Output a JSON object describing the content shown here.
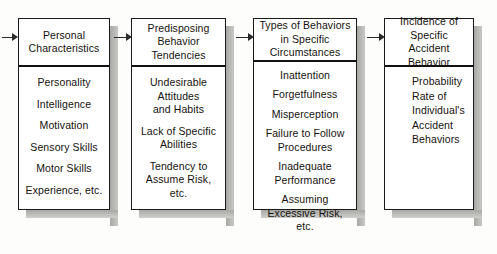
{
  "diagram": {
    "background_color": "#fdfdfc",
    "text_color": "#15110e",
    "shadow_color": "#a8a8a4",
    "boxes": [
      {
        "id": "personal-characteristics",
        "header": "Personal\nCharacteristics",
        "align": "center",
        "entries": [
          "Personality",
          "Intelligence",
          "Motivation",
          "Sensory Skills",
          "Motor Skills",
          "Experience, etc."
        ]
      },
      {
        "id": "predisposing-behavior-tendencies",
        "header": "Predisposing\nBehavior\nTendencies",
        "align": "center",
        "entries": [
          "Undesirable\nAttitudes\nand Habits",
          "Lack of Specific\nAbilities",
          "Tendency to\nAssume Risk, etc."
        ]
      },
      {
        "id": "types-of-behaviors",
        "header": "Types of Behaviors\nin Specific\nCircumstances",
        "align": "center",
        "entries": [
          "Inattention",
          "Forgetfulness",
          "Misperception",
          "Failure to Follow\nProcedures",
          "Inadequate\nPerformance",
          "Assuming\nExcessive Risk, etc."
        ]
      },
      {
        "id": "incidence-of-specific-accident-behavior",
        "header": "Incidence of\nSpecific Accident\nBehavior",
        "align": "left",
        "entries": [
          "Probability",
          "Rate of",
          "Individual's",
          "Accident",
          "Behaviors"
        ]
      }
    ],
    "connectors": [
      {
        "id": "inflow-arrow",
        "from": "",
        "to": "personal-characteristics"
      },
      {
        "id": "arrow-1-2",
        "from": "personal-characteristics",
        "to": "predisposing-behavior-tendencies"
      },
      {
        "id": "arrow-2-3",
        "from": "predisposing-behavior-tendencies",
        "to": "types-of-behaviors"
      },
      {
        "id": "arrow-3-4",
        "from": "types-of-behaviors",
        "to": "incidence-of-specific-accident-behavior"
      }
    ]
  }
}
